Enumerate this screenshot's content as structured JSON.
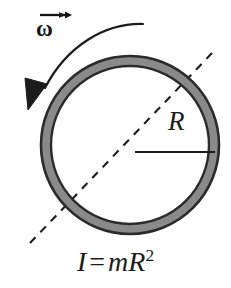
{
  "figure": {
    "type": "physics-diagram",
    "background_color": "#ffffff"
  },
  "ring": {
    "name": "hoop",
    "center_x": 130,
    "center_y": 145,
    "outer_radius": 89,
    "inner_radius": 79,
    "fill_color": "#8a8a8a",
    "stroke_color": "#2b2b2b",
    "stroke_width": 2.4
  },
  "angular_velocity": {
    "symbol": "ω",
    "vector_arrow": "→",
    "label_name": "omega-vector-label",
    "arrow_direction": "counterclockwise",
    "arrow_color": "#1c1c1c"
  },
  "radius": {
    "label": "R",
    "line_color": "#1c1c1c",
    "from_x": 135,
    "from_y": 152,
    "to_x": 214,
    "to_y": 152
  },
  "axis": {
    "name": "rotation-axis",
    "style": "dashed",
    "color": "#1c1c1c",
    "x1": 30,
    "y1": 243,
    "x2": 213,
    "y2": 52
  },
  "equation": {
    "full": "I = mR²",
    "left_symbol": "I",
    "operator": "=",
    "mass_symbol": "m",
    "radius_symbol": "R",
    "exponent": "2"
  },
  "colors": {
    "ink": "#1c1c1c",
    "ring_fill": "#8a8a8a",
    "ring_stroke": "#2b2b2b",
    "paper": "#ffffff"
  }
}
